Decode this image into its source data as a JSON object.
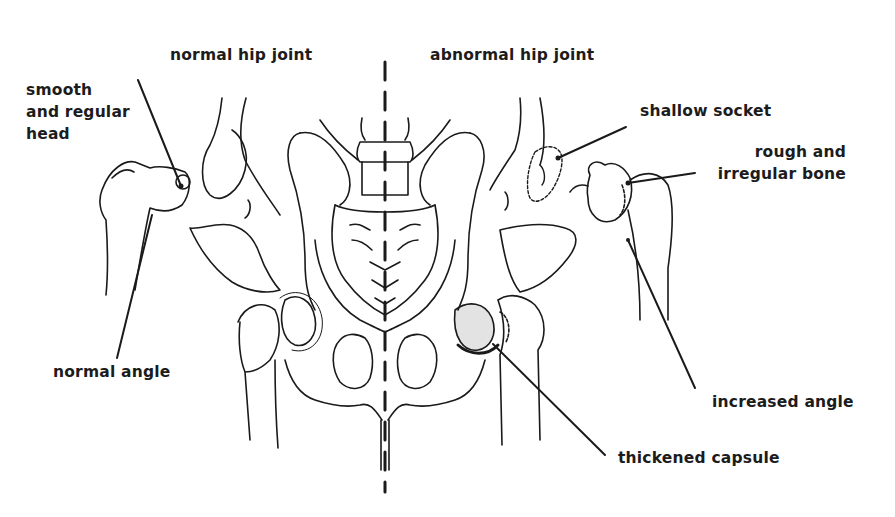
{
  "diagram": {
    "type": "anatomical-illustration",
    "headings": {
      "left": "normal hip joint",
      "right": "abnormal hip joint"
    },
    "labels": {
      "smooth_head": [
        "smooth",
        "and regular",
        "head"
      ],
      "normal_angle": "normal angle",
      "shallow_socket": "shallow socket",
      "rough_bone": [
        "rough and",
        "irregular bone"
      ],
      "increased_angle": "increased angle",
      "thickened_capsule": "thickened capsule"
    },
    "colors": {
      "background": "#ffffff",
      "ink": "#1a1a1a"
    }
  }
}
